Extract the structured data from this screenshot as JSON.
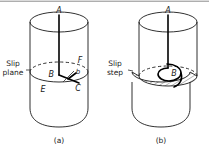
{
  "figure": {
    "background_color": "#ffffff",
    "line_color": "#1a1a1a",
    "panels": [
      {
        "id": "a",
        "caption": "(a)",
        "side_label": {
          "line1": "Slip",
          "line2": "plane"
        },
        "point_labels": {
          "axis_top": "A",
          "center": "B",
          "burgers": "b",
          "right_rear": "F",
          "left_front": "E",
          "right_front": "C"
        }
      },
      {
        "id": "b",
        "caption": "(b)",
        "side_label": {
          "line1": "Slip",
          "line2": "step"
        },
        "point_labels": {
          "axis_top": "A",
          "center": "B"
        }
      }
    ]
  }
}
